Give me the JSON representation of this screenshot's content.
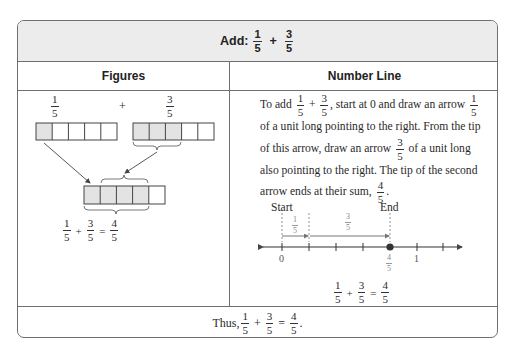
{
  "header": {
    "title_prefix": "Add:",
    "fraction_a": {
      "num": "1",
      "den": "5"
    },
    "operator": "+",
    "fraction_b": {
      "num": "3",
      "den": "5"
    }
  },
  "columns": {
    "left_title": "Figures",
    "right_title": "Number Line"
  },
  "figures": {
    "top_left_fraction": {
      "num": "1",
      "den": "5"
    },
    "top_operator": "+",
    "top_right_fraction": {
      "num": "3",
      "den": "5"
    },
    "bar_a_shaded": 1,
    "bar_b_shaded": 3,
    "result_bar_shaded": 4,
    "cells_per_bar": 5,
    "equation": {
      "a": {
        "num": "1",
        "den": "5"
      },
      "plus": "+",
      "b": {
        "num": "3",
        "den": "5"
      },
      "equals": "=",
      "result": {
        "num": "4",
        "den": "5"
      }
    },
    "shade_color": "#e3e3e3"
  },
  "number_line": {
    "paragraph": {
      "p1": "To add",
      "plus": "+",
      "p2": ", start at 0 and draw an arrow",
      "p3": "of a unit long pointing to the right. From the tip of this arrow, draw an arrow",
      "p4": "of a unit long also pointing to the right. The tip of the second arrow ends at their sum,",
      "p5": ".",
      "f1": {
        "num": "1",
        "den": "5"
      },
      "f2": {
        "num": "3",
        "den": "5"
      },
      "f3": {
        "num": "1",
        "den": "5"
      },
      "f4": {
        "num": "3",
        "den": "5"
      },
      "f5": {
        "num": "4",
        "den": "5"
      }
    },
    "start_label": "Start",
    "end_label": "End",
    "segment1_label": {
      "num": "1",
      "den": "5"
    },
    "segment2_label": {
      "num": "3",
      "den": "5"
    },
    "tick_label_zero": "0",
    "tick_label_one": "1",
    "point_label": {
      "num": "4",
      "den": "5"
    },
    "equation": {
      "a": {
        "num": "1",
        "den": "5"
      },
      "plus": "+",
      "b": {
        "num": "3",
        "den": "5"
      },
      "equals": "=",
      "result": {
        "num": "4",
        "den": "5"
      }
    }
  },
  "conclusion": {
    "prefix": "Thus,",
    "a": {
      "num": "1",
      "den": "5"
    },
    "plus": "+",
    "b": {
      "num": "3",
      "den": "5"
    },
    "equals": "=",
    "result": {
      "num": "4",
      "den": "5"
    },
    "suffix": "."
  }
}
